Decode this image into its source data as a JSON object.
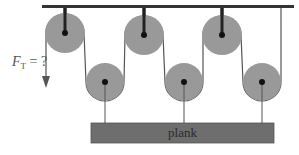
{
  "diagram": {
    "force_label": {
      "symbol": "F",
      "subscript": "T",
      "equals": "= ?"
    },
    "plank_label": "plank",
    "pulleys": {
      "fixed_top": [
        {
          "cx": 65,
          "cy": 33,
          "r": 20
        },
        {
          "cx": 144,
          "cy": 35,
          "r": 20
        },
        {
          "cx": 222,
          "cy": 35,
          "r": 20
        }
      ],
      "movable_bottom": [
        {
          "cx": 105,
          "cy": 82,
          "r": 19
        },
        {
          "cx": 184,
          "cy": 82,
          "r": 19
        },
        {
          "cx": 262,
          "cy": 82,
          "r": 19
        }
      ]
    },
    "colors": {
      "pulley_fill": "#999999",
      "ceiling": "#333333",
      "rope": "#555555",
      "plank_fill": "#6e6e6e",
      "axle": "#111111"
    }
  }
}
